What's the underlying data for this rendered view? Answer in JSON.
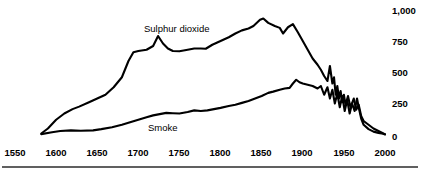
{
  "chart_data": {
    "type": "line",
    "title": "",
    "subtitle": "",
    "xlabel": "",
    "ylabel": "",
    "xlim": [
      1550,
      2000
    ],
    "ylim": [
      0,
      1000
    ],
    "grid": false,
    "legend_position": "inline-annotation",
    "x_tick_labels": [
      "1550",
      "1600",
      "1650",
      "1700",
      "1750",
      "1800",
      "1850",
      "1900",
      "1950",
      "2000"
    ],
    "x_ticks": [
      1550,
      1600,
      1650,
      1700,
      1750,
      1800,
      1850,
      1900,
      1950,
      2000
    ],
    "y_tick_labels": [
      "1,000",
      "750",
      "500",
      "250",
      "0"
    ],
    "y_ticks": [
      1000,
      750,
      500,
      250,
      0
    ],
    "annotations": [
      {
        "name": "sulphur-dioxide-label",
        "text": "Sulphur dioxide",
        "x": 1727,
        "y": 905
      },
      {
        "name": "smoke-label",
        "text": "Smoke",
        "x": 1730,
        "y": 140
      }
    ],
    "series": [
      {
        "name": "Sulphur dioxide",
        "color": "#000000",
        "points": [
          [
            1582,
            20
          ],
          [
            1590,
            60
          ],
          [
            1600,
            130
          ],
          [
            1610,
            180
          ],
          [
            1620,
            215
          ],
          [
            1628,
            235
          ],
          [
            1640,
            270
          ],
          [
            1650,
            300
          ],
          [
            1660,
            330
          ],
          [
            1670,
            390
          ],
          [
            1680,
            470
          ],
          [
            1688,
            600
          ],
          [
            1694,
            670
          ],
          [
            1700,
            680
          ],
          [
            1710,
            690
          ],
          [
            1718,
            720
          ],
          [
            1724,
            800
          ],
          [
            1730,
            740
          ],
          [
            1736,
            700
          ],
          [
            1742,
            680
          ],
          [
            1750,
            678
          ],
          [
            1760,
            690
          ],
          [
            1768,
            700
          ],
          [
            1776,
            700
          ],
          [
            1782,
            698
          ],
          [
            1790,
            730
          ],
          [
            1800,
            760
          ],
          [
            1810,
            790
          ],
          [
            1818,
            820
          ],
          [
            1826,
            845
          ],
          [
            1834,
            860
          ],
          [
            1840,
            880
          ],
          [
            1848,
            930
          ],
          [
            1852,
            940
          ],
          [
            1858,
            905
          ],
          [
            1866,
            880
          ],
          [
            1872,
            865
          ],
          [
            1876,
            820
          ],
          [
            1882,
            870
          ],
          [
            1888,
            895
          ],
          [
            1894,
            830
          ],
          [
            1900,
            760
          ],
          [
            1906,
            690
          ],
          [
            1912,
            620
          ],
          [
            1918,
            570
          ],
          [
            1922,
            530
          ],
          [
            1926,
            480
          ],
          [
            1930,
            440
          ],
          [
            1933,
            560
          ],
          [
            1936,
            420
          ],
          [
            1938,
            470
          ],
          [
            1940,
            330
          ],
          [
            1942,
            400
          ],
          [
            1944,
            300
          ],
          [
            1946,
            360
          ],
          [
            1948,
            270
          ],
          [
            1950,
            330
          ],
          [
            1952,
            250
          ],
          [
            1955,
            320
          ],
          [
            1958,
            230
          ],
          [
            1962,
            300
          ],
          [
            1965,
            210
          ],
          [
            1968,
            250
          ],
          [
            1971,
            160
          ],
          [
            1974,
            120
          ],
          [
            1980,
            90
          ],
          [
            1986,
            60
          ],
          [
            1992,
            40
          ],
          [
            1998,
            20
          ],
          [
            2000,
            15
          ]
        ]
      },
      {
        "name": "Smoke",
        "color": "#000000",
        "points": [
          [
            1582,
            15
          ],
          [
            1595,
            30
          ],
          [
            1605,
            40
          ],
          [
            1618,
            45
          ],
          [
            1630,
            42
          ],
          [
            1645,
            45
          ],
          [
            1655,
            55
          ],
          [
            1668,
            70
          ],
          [
            1680,
            90
          ],
          [
            1690,
            110
          ],
          [
            1700,
            130
          ],
          [
            1710,
            150
          ],
          [
            1718,
            165
          ],
          [
            1726,
            175
          ],
          [
            1734,
            185
          ],
          [
            1742,
            182
          ],
          [
            1750,
            180
          ],
          [
            1760,
            192
          ],
          [
            1768,
            205
          ],
          [
            1776,
            200
          ],
          [
            1784,
            205
          ],
          [
            1792,
            215
          ],
          [
            1800,
            225
          ],
          [
            1810,
            240
          ],
          [
            1818,
            250
          ],
          [
            1826,
            265
          ],
          [
            1834,
            280
          ],
          [
            1842,
            300
          ],
          [
            1850,
            320
          ],
          [
            1858,
            345
          ],
          [
            1864,
            355
          ],
          [
            1872,
            370
          ],
          [
            1878,
            380
          ],
          [
            1884,
            385
          ],
          [
            1888,
            420
          ],
          [
            1892,
            450
          ],
          [
            1896,
            430
          ],
          [
            1900,
            420
          ],
          [
            1906,
            410
          ],
          [
            1912,
            400
          ],
          [
            1918,
            380
          ],
          [
            1922,
            400
          ],
          [
            1926,
            330
          ],
          [
            1930,
            390
          ],
          [
            1933,
            300
          ],
          [
            1936,
            370
          ],
          [
            1939,
            260
          ],
          [
            1942,
            340
          ],
          [
            1945,
            230
          ],
          [
            1948,
            320
          ],
          [
            1951,
            200
          ],
          [
            1954,
            290
          ],
          [
            1957,
            180
          ],
          [
            1960,
            260
          ],
          [
            1963,
            200
          ],
          [
            1966,
            300
          ],
          [
            1968,
            230
          ],
          [
            1971,
            140
          ],
          [
            1974,
            90
          ],
          [
            1980,
            55
          ],
          [
            1986,
            35
          ],
          [
            1992,
            25
          ],
          [
            1998,
            18
          ],
          [
            2000,
            12
          ]
        ]
      }
    ]
  },
  "footer": {
    "divider": ""
  }
}
